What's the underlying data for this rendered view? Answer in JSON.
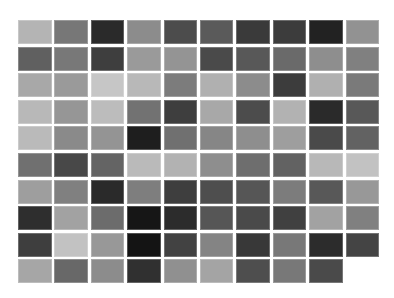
{
  "grid": {
    "columns": 10,
    "rows": 10,
    "cells": [
      [
        "#b4b4b4",
        "#777777",
        "#2a2a2a",
        "#8c8c8c",
        "#4c4c4c",
        "#5a5a5a",
        "#3a3a3a",
        "#3c3c3c",
        "#222222",
        "#929292"
      ],
      [
        "#606060",
        "#787878",
        "#3e3e3e",
        "#9a9a9a",
        "#949494",
        "#4a4a4a",
        "#585858",
        "#6a6a6a",
        "#8e8e8e",
        "#808080"
      ],
      [
        "#a8a8a8",
        "#9a9a9a",
        "#c6c6c6",
        "#b8b8b8",
        "#7c7c7c",
        "#b0b0b0",
        "#8c8c8c",
        "#3c3c3c",
        "#b0b0b0",
        "#7a7a7a"
      ],
      [
        "#b8b8b8",
        "#969696",
        "#bcbcbc",
        "#727272",
        "#3e3e3e",
        "#a8a8a8",
        "#4c4c4c",
        "#b2b2b2",
        "#2a2a2a",
        "#585858"
      ],
      [
        "#bababa",
        "#8a8a8a",
        "#949494",
        "#1e1e1e",
        "#707070",
        "#868686",
        "#8e8e8e",
        "#9e9e9e",
        "#4a4a4a",
        "#626262"
      ],
      [
        "#707070",
        "#484848",
        "#646464",
        "#bababa",
        "#b2b2b2",
        "#8e8e8e",
        "#6e6e6e",
        "#626262",
        "#b8b8b8",
        "#c2c2c2"
      ],
      [
        "#9e9e9e",
        "#808080",
        "#2a2a2a",
        "#7e7e7e",
        "#3e3e3e",
        "#4e4e4e",
        "#565656",
        "#7c7c7c",
        "#585858",
        "#989898"
      ],
      [
        "#2e2e2e",
        "#a2a2a2",
        "#6c6c6c",
        "#161616",
        "#2c2c2c",
        "#565656",
        "#4a4a4a",
        "#404040",
        "#a2a2a2",
        "#808080"
      ],
      [
        "#3e3e3e",
        "#c2c2c2",
        "#989898",
        "#141414",
        "#424242",
        "#848484",
        "#383838",
        "#787878",
        "#2c2c2c",
        "#444444"
      ],
      [
        "#a6a6a6",
        "#686868",
        "#8c8c8c",
        "#303030",
        "#909090",
        "#a4a4a4",
        "#4e4e4e",
        "#787878",
        "#4a4a4a"
      ]
    ]
  }
}
